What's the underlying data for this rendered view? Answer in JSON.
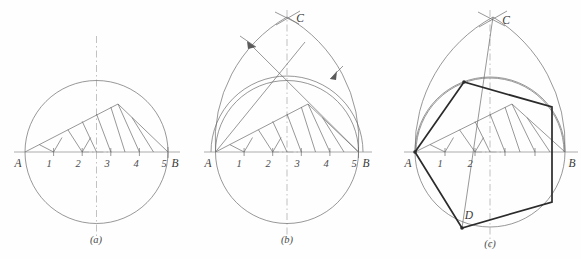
{
  "sheet": {
    "title": "Construction of a regular polygon inscribed in a circle and in an oval",
    "background_color": "#fefefe",
    "line_color": "#6b6b6b",
    "heavy_line_color": "#2b2b2b",
    "axis_color": "#8a8a8a",
    "centerline_color": "#a8a8a8"
  },
  "figures": [
    {
      "id": "a",
      "caption": "(a)",
      "caption_x": 96,
      "caption_y": 243,
      "description": "circle with diameter AB divided into five equal parts and a hatched fan",
      "endpoint_left_label": "A",
      "endpoint_right_label": "B",
      "apex_label": "",
      "lower_label": "",
      "division_labels": [
        "1",
        "2",
        "3",
        "4",
        "5"
      ],
      "geometry": {
        "center_x": 96.5,
        "center_y": 152,
        "radius": 71.5,
        "a_x": 25,
        "b_x": 168,
        "baseline_y": 152,
        "divisions": 5,
        "label_y": 165,
        "fan_apex_x": 118,
        "fan_apex_y": 104
      }
    },
    {
      "id": "b",
      "caption": "(b)",
      "caption_x": 287,
      "caption_y": 243,
      "description": "oval built on diameter AB with apex C, construction arcs with arrowheads, and the same hatched fan",
      "endpoint_left_label": "A",
      "endpoint_right_label": "B",
      "apex_label": "C",
      "lower_label": "",
      "division_labels": [
        "1",
        "2",
        "3",
        "4",
        "5"
      ],
      "geometry": {
        "center_x": 287,
        "center_y": 152,
        "radius": 71.5,
        "a_x": 215.5,
        "b_x": 358.5,
        "baseline_y": 152,
        "apex_x": 287,
        "apex_y": 17,
        "divisions": 5,
        "label_y": 165,
        "fan_apex_x": 308,
        "fan_apex_y": 104
      }
    },
    {
      "id": "c",
      "caption": "(c)",
      "caption_x": 490,
      "caption_y": 247,
      "description": "oval with apex C and point D, with a heavy inscribed six-sided polygon A-P1-P2-B-P4-D",
      "endpoint_left_label": "A",
      "endpoint_right_label": "B",
      "apex_label": "C",
      "lower_label": "D",
      "division_labels": [
        "1",
        "2"
      ],
      "geometry": {
        "center_x": 490,
        "center_y": 152,
        "radius": 75,
        "a_x": 415,
        "b_x": 565,
        "baseline_y": 152,
        "apex_x": 493,
        "apex_y": 17,
        "d_x": 462,
        "d_y": 228,
        "divisions": 5,
        "label_y": 165,
        "fan_apex_x": 512,
        "fan_apex_y": 104
      },
      "polygon_vertices": [
        {
          "name": "A",
          "x": 415,
          "y": 152
        },
        {
          "name": "P1",
          "x": 464,
          "y": 82
        },
        {
          "name": "P2",
          "x": 552,
          "y": 107
        },
        {
          "name": "B",
          "x": 552,
          "y": 202
        },
        {
          "name": "P4",
          "x": 462,
          "y": 228
        },
        {
          "name": "D",
          "x": 415,
          "y": 152
        }
      ]
    }
  ]
}
